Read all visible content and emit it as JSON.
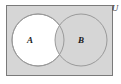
{
  "figure": {
    "name": "venn-diagram",
    "type": "set-venn-diagram",
    "width": 121,
    "height": 84,
    "canvas_background": "#ffffff"
  },
  "universe": {
    "label": "U",
    "label_x": 115,
    "label_y": 11,
    "rect": {
      "x": 6,
      "y": 5,
      "width": 107,
      "height": 71
    },
    "fill": "#d6d6d6",
    "stroke": "#7a7a7a",
    "stroke_width": 1
  },
  "sets": [
    {
      "label": "A",
      "name": "circle-a",
      "cx": 38,
      "cy": 40,
      "r": 26,
      "fill": "#ffffff",
      "stroke": "#9a9a9a",
      "stroke_width": 1,
      "label_x": 30,
      "label_y": 43
    },
    {
      "label": "B",
      "name": "circle-b",
      "cx": 81,
      "cy": 40,
      "r": 26,
      "fill": "#d6d6d6",
      "stroke": "#9a9a9a",
      "stroke_width": 1,
      "label_x": 81,
      "label_y": 43
    }
  ],
  "shading": {
    "description": "Region A minus B is white (unshaded); the rest of the universe including B and the intersection is shaded grey.",
    "shaded_fill": "#d6d6d6",
    "unshaded_fill": "#ffffff"
  }
}
